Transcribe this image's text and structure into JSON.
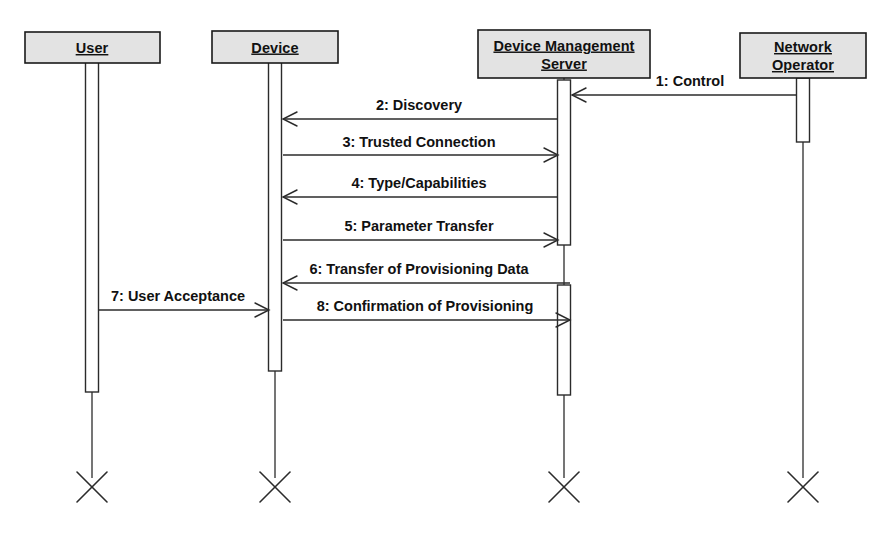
{
  "diagram": {
    "type": "uml-sequence-diagram",
    "canvas": {
      "width": 893,
      "height": 537,
      "background": "#ffffff"
    },
    "colors": {
      "box_fill": "#e3e3e3",
      "line": "#2b2b2b",
      "box_border": "#1a1a1a",
      "text": "#111111",
      "activation_fill": "#ffffff"
    },
    "lifelines": [
      {
        "id": "user",
        "label_lines": [
          "User"
        ],
        "label": "User",
        "box": {
          "x": 25,
          "y": 32,
          "w": 135,
          "h": 31
        },
        "center_x": 92,
        "line_top": 63,
        "line_bottom": 478,
        "terminator": {
          "cx": 92,
          "cy": 487,
          "size": 15
        },
        "activations": [
          {
            "y": 62,
            "h": 330,
            "w": 13
          }
        ]
      },
      {
        "id": "device",
        "label_lines": [
          "Device"
        ],
        "label": "Device",
        "box": {
          "x": 212,
          "y": 31,
          "w": 126,
          "h": 32
        },
        "center_x": 275,
        "line_top": 63,
        "line_bottom": 478,
        "terminator": {
          "cx": 275,
          "cy": 487,
          "size": 15
        },
        "activations": [
          {
            "y": 62,
            "h": 309,
            "w": 13
          }
        ]
      },
      {
        "id": "dms",
        "label_lines": [
          "Device Management",
          "Server"
        ],
        "label": "Device Management Server",
        "box": {
          "x": 478,
          "y": 30,
          "w": 172,
          "h": 48
        },
        "center_x": 564,
        "line_top": 78,
        "line_bottom": 478,
        "terminator": {
          "cx": 564,
          "cy": 487,
          "size": 15
        },
        "activations": [
          {
            "y": 80,
            "h": 165,
            "w": 13
          },
          {
            "y": 285,
            "h": 110,
            "w": 13
          }
        ]
      },
      {
        "id": "network_operator",
        "label_lines": [
          "Network",
          "Operator"
        ],
        "label": "Network Operator",
        "box": {
          "x": 740,
          "y": 33,
          "w": 126,
          "h": 45
        },
        "center_x": 803,
        "line_top": 78,
        "line_bottom": 478,
        "terminator": {
          "cx": 803,
          "cy": 487,
          "size": 15
        },
        "activations": [
          {
            "y": 78,
            "h": 64,
            "w": 13
          }
        ]
      }
    ],
    "messages": [
      {
        "seq": "1",
        "label": "1: Control",
        "from": "network_operator",
        "to": "dms",
        "direction": "right-to-left",
        "y": 95,
        "label_x": 690,
        "label_y": 86,
        "x_start": 797,
        "x_end": 572
      },
      {
        "seq": "2",
        "label": "2: Discovery",
        "from": "dms",
        "to": "device",
        "direction": "right-to-left",
        "y": 119,
        "label_x": 419,
        "label_y": 110,
        "x_start": 558,
        "x_end": 283
      },
      {
        "seq": "3",
        "label": "3: Trusted Connection",
        "from": "device",
        "to": "dms",
        "direction": "left-to-right",
        "y": 155,
        "label_x": 419,
        "label_y": 147,
        "x_start": 283,
        "x_end": 558
      },
      {
        "seq": "4",
        "label": "4: Type/Capabilities",
        "from": "dms",
        "to": "device",
        "direction": "right-to-left",
        "y": 197,
        "label_x": 419,
        "label_y": 188,
        "x_start": 558,
        "x_end": 283
      },
      {
        "seq": "5",
        "label": "5: Parameter Transfer",
        "from": "device",
        "to": "dms",
        "direction": "left-to-right",
        "y": 240,
        "label_x": 419,
        "label_y": 231,
        "x_start": 283,
        "x_end": 558
      },
      {
        "seq": "6",
        "label": "6: Transfer of Provisioning Data",
        "from": "dms",
        "to": "device",
        "direction": "right-to-left",
        "y": 283,
        "label_x": 419,
        "label_y": 274,
        "x_start": 570,
        "x_end": 283
      },
      {
        "seq": "7",
        "label": "7: User Acceptance",
        "from": "user",
        "to": "device",
        "direction": "left-to-right",
        "y": 310,
        "label_x": 178,
        "label_y": 301,
        "x_start": 99,
        "x_end": 269
      },
      {
        "seq": "8",
        "label": "8: Confirmation of Provisioning",
        "from": "device",
        "to": "dms",
        "direction": "left-to-right",
        "y": 320,
        "label_x": 425,
        "label_y": 311,
        "x_start": 283,
        "x_end": 570
      }
    ]
  }
}
